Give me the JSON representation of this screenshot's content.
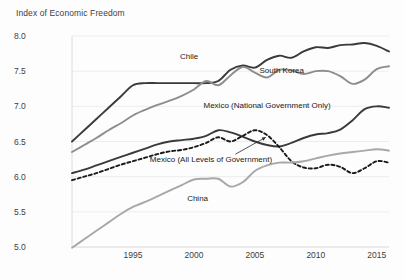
{
  "chart_data": {
    "type": "line",
    "title": "Index of Economic Freedom",
    "xlabel": "",
    "ylabel": "Index of Economic Freedom",
    "xlim": [
      1990,
      2016
    ],
    "ylim": [
      4.75,
      8.0
    ],
    "ytick_labels": [
      "8.0",
      "7.5",
      "7.0",
      "6.5",
      "6.0",
      "5.5",
      "5.0"
    ],
    "ytick_values": [
      8.0,
      7.5,
      7.0,
      6.5,
      6.0,
      5.5,
      5.0
    ],
    "xtick_labels": [
      "1995",
      "2000",
      "2005",
      "2010",
      "2015"
    ],
    "xtick_values": [
      1995,
      2000,
      2005,
      2010,
      2015
    ],
    "grid": "horizontal",
    "legend": "inline-annotations",
    "x": [
      1990,
      1991,
      1992,
      1993,
      1994,
      1995,
      1996,
      1997,
      1998,
      1999,
      2000,
      2001,
      2002,
      2003,
      2004,
      2005,
      2006,
      2007,
      2008,
      2009,
      2010,
      2011,
      2012,
      2013,
      2014,
      2015,
      2016
    ],
    "series": [
      {
        "name": "Chile",
        "color": "#3a3a3a",
        "style": "solid",
        "label_x": 1999.6,
        "label_y": 7.72,
        "values": [
          6.5,
          6.66,
          6.82,
          6.98,
          7.14,
          7.3,
          7.33,
          7.33,
          7.33,
          7.33,
          7.33,
          7.33,
          7.36,
          7.52,
          7.58,
          7.55,
          7.66,
          7.72,
          7.69,
          7.78,
          7.84,
          7.83,
          7.87,
          7.88,
          7.9,
          7.86,
          7.78
        ]
      },
      {
        "name": "South Korea",
        "color": "#8d8d8d",
        "style": "solid",
        "label_x": 2007.2,
        "label_y": 7.52,
        "values": [
          6.35,
          6.45,
          6.55,
          6.66,
          6.76,
          6.87,
          6.95,
          7.02,
          7.08,
          7.15,
          7.24,
          7.36,
          7.3,
          7.44,
          7.56,
          7.48,
          7.41,
          7.52,
          7.51,
          7.46,
          7.5,
          7.5,
          7.43,
          7.32,
          7.38,
          7.53,
          7.57
        ]
      },
      {
        "name": "Mexico (National Government Only)",
        "color": "#3a3a3a",
        "style": "solid",
        "label_x": 2006.0,
        "label_y": 7.02,
        "values": [
          6.05,
          6.1,
          6.16,
          6.22,
          6.28,
          6.34,
          6.4,
          6.46,
          6.5,
          6.52,
          6.54,
          6.58,
          6.66,
          6.63,
          6.57,
          6.5,
          6.45,
          6.43,
          6.48,
          6.55,
          6.6,
          6.62,
          6.67,
          6.8,
          6.96,
          7.0,
          6.98
        ]
      },
      {
        "name": "Mexico (All Levels of Government)",
        "color": "#1a1a1a",
        "style": "dashed",
        "label_x": 2001.4,
        "label_y": 6.25,
        "arrow_from": [
          2003.4,
          6.32
        ],
        "arrow_to": [
          2005.9,
          6.56
        ],
        "values": [
          5.95,
          6.0,
          6.05,
          6.11,
          6.17,
          6.22,
          6.27,
          6.32,
          6.36,
          6.38,
          6.42,
          6.48,
          6.56,
          6.5,
          6.58,
          6.66,
          6.59,
          6.42,
          6.22,
          6.13,
          6.12,
          6.17,
          6.14,
          6.05,
          6.12,
          6.22,
          6.2
        ]
      },
      {
        "name": "China",
        "color": "#a8a8a8",
        "style": "solid",
        "label_x": 2000.3,
        "label_y": 5.7,
        "values": [
          4.99,
          5.11,
          5.23,
          5.35,
          5.47,
          5.57,
          5.64,
          5.72,
          5.8,
          5.88,
          5.96,
          5.97,
          5.97,
          5.86,
          5.92,
          6.08,
          6.16,
          6.2,
          6.2,
          6.22,
          6.26,
          6.3,
          6.33,
          6.35,
          6.37,
          6.39,
          6.37
        ]
      }
    ]
  }
}
